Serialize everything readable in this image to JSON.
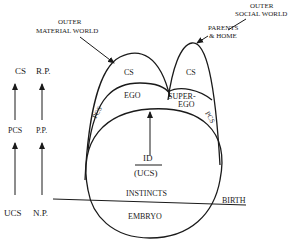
{
  "diagram": {
    "type": "psychoanalytic-topography",
    "left_scales": {
      "column1": [
        "CS",
        "PCS",
        "UCS"
      ],
      "column2": [
        "R.P.",
        "P.P.",
        "N.P."
      ]
    },
    "annotations": {
      "outer_material_world_line1": "OUTER",
      "outer_material_world_line2": "MATERIAL WORLD",
      "outer_social_world_line1": "OUTER",
      "outer_social_world_line2": "SOCIAL WORLD",
      "parents_home_line1": "PARENTS",
      "parents_home_line2": "& HOME",
      "birth": "BIRTH"
    },
    "regions": {
      "cs_left": "CS",
      "ego": "EGO",
      "pcs_left": "PCS",
      "cs_right": "CS",
      "superego_line1": "SUPER-",
      "superego_line2": "EGO",
      "pcs_right": "PCS",
      "id": "ID",
      "ucs": "(UCS)",
      "instincts": "INSTINCTS",
      "embryo": "EMBRYO"
    }
  }
}
